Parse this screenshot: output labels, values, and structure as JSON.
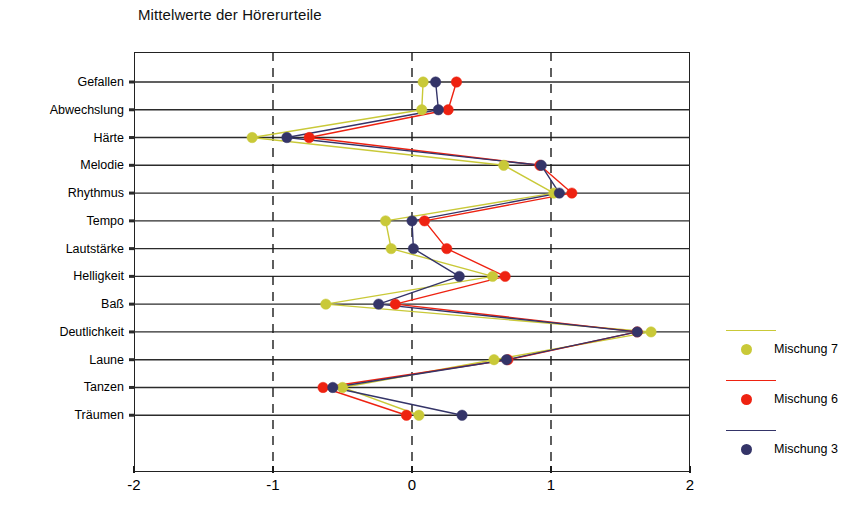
{
  "chart_data": {
    "type": "line",
    "title": "Mittelwerte der Hörerurteile",
    "orientation": "horizontal",
    "xlabel": "",
    "ylabel": "",
    "xlim": [
      -2,
      2
    ],
    "xticks": [
      -2,
      -1,
      0,
      1,
      2
    ],
    "xtick_labels": [
      "-2",
      "-1",
      "0",
      "1",
      "2"
    ],
    "grid": true,
    "grid_style": "horizontal solid rows, vertical dashed at -1, 0, 1",
    "legend_position": "right",
    "categories": [
      "Gefallen",
      "Abwechslung",
      "Härte",
      "Melodie",
      "Rhythmus",
      "Tempo",
      "Lautstärke",
      "Helligkeit",
      "Baß",
      "Deutlichkeit",
      "Laune",
      "Tanzen",
      "Träumen"
    ],
    "series": [
      {
        "name": "Mischung 7",
        "color": "#c9c938",
        "values": [
          0.08,
          0.07,
          -1.15,
          0.66,
          1.02,
          -0.19,
          -0.15,
          0.58,
          -0.62,
          1.72,
          0.59,
          -0.5,
          0.05
        ]
      },
      {
        "name": "Mischung 6",
        "color": "#ee2211",
        "values": [
          0.32,
          0.26,
          -0.74,
          0.92,
          1.15,
          0.09,
          0.25,
          0.67,
          -0.12,
          1.62,
          0.69,
          -0.64,
          -0.04
        ]
      },
      {
        "name": "Mischung 3",
        "color": "#343468",
        "values": [
          0.17,
          0.19,
          -0.9,
          0.93,
          1.06,
          0.0,
          0.01,
          0.34,
          -0.24,
          1.62,
          0.68,
          -0.57,
          0.36
        ]
      }
    ]
  },
  "legend": {
    "entries": [
      {
        "label": "Mischung 7",
        "color": "#c9c938"
      },
      {
        "label": "Mischung 6",
        "color": "#ee2211"
      },
      {
        "label": "Mischung 3",
        "color": "#343468"
      }
    ]
  }
}
